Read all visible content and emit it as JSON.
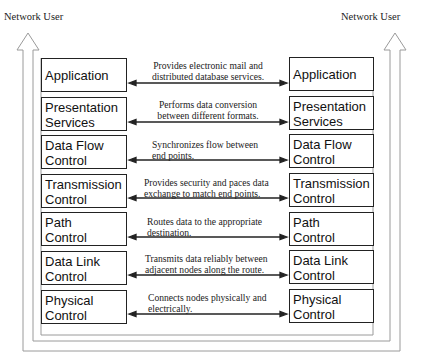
{
  "diagram": {
    "left_user_label": "Network User",
    "right_user_label": "Network User",
    "layers": [
      {
        "left": [
          "Application"
        ],
        "right": [
          "Application"
        ],
        "description": [
          "Provides electronic mail and",
          "distributed database services."
        ]
      },
      {
        "left": [
          "Presentation",
          "Services"
        ],
        "right": [
          "Presentation",
          "Services"
        ],
        "description": [
          "Performs data conversion",
          "between different formats."
        ]
      },
      {
        "left": [
          "Data Flow",
          "Control"
        ],
        "right": [
          "Data Flow",
          "Control"
        ],
        "description": [
          "Synchronizes flow between",
          "end points."
        ]
      },
      {
        "left": [
          "Transmission",
          "Control"
        ],
        "right": [
          "Transmission",
          "Control"
        ],
        "description": [
          "Provides security and paces data",
          "exchange to match end points."
        ]
      },
      {
        "left": [
          "Path",
          "Control"
        ],
        "right": [
          "Path",
          "Control"
        ],
        "description": [
          "Routes data to the appropriate",
          "destination."
        ]
      },
      {
        "left": [
          "Data Link",
          "Control"
        ],
        "right": [
          "Data Link",
          "Control"
        ],
        "description": [
          "Transmits data reliably between",
          "adjacent nodes along the route."
        ]
      },
      {
        "left": [
          "Physical",
          "Control"
        ],
        "right": [
          "Physical",
          "Control"
        ],
        "description": [
          "Connects nodes physically and",
          "electrically."
        ]
      }
    ],
    "colors": {
      "line": "#222222",
      "outline": "#999999",
      "background": "#ffffff"
    }
  }
}
